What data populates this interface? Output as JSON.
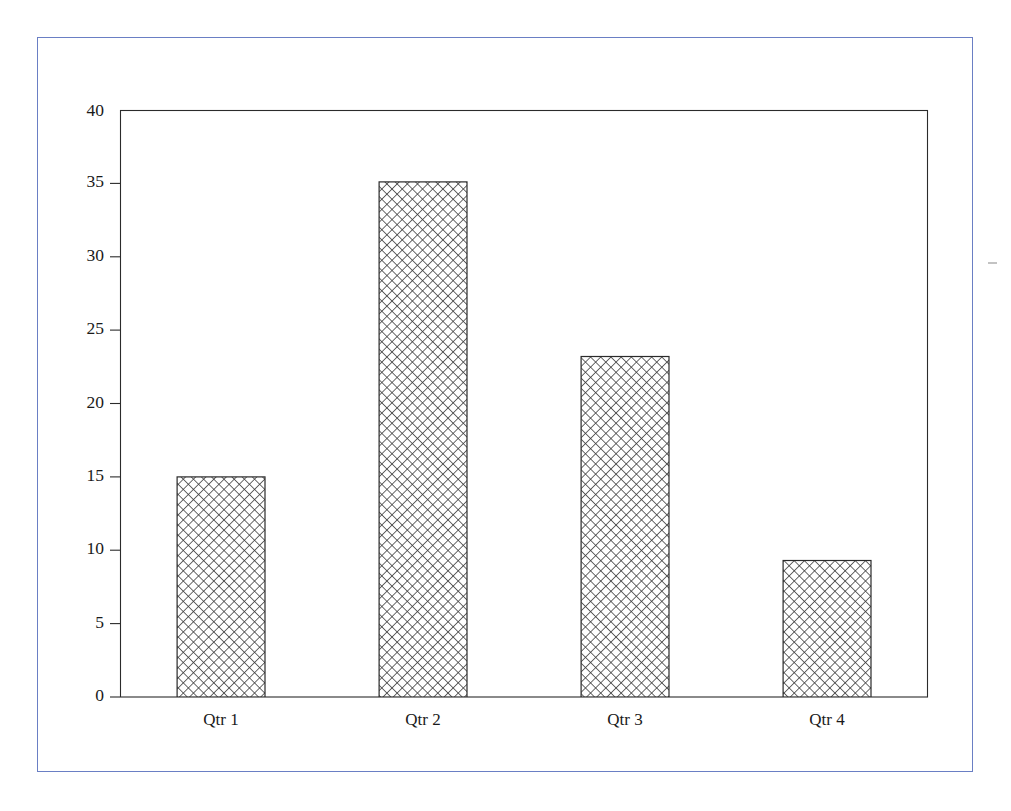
{
  "figure": {
    "border_color": "#6a7fc4",
    "background_color": "#ffffff",
    "axis_color": "#2b2b2b",
    "bar_outline_color": "#2a2a2a",
    "hatch_color": "#3a3a3a"
  },
  "chart_data": {
    "type": "bar",
    "title": "",
    "subtitle": "",
    "xlabel": "",
    "ylabel": "",
    "categories": [
      "Qtr 1",
      "Qtr 2",
      "Qtr 3",
      "Qtr 4"
    ],
    "values": [
      15,
      35.1,
      23.2,
      9.3
    ],
    "series": [
      {
        "name": "",
        "values": [
          15,
          35.1,
          23.2,
          9.3
        ]
      }
    ],
    "ylim": [
      0,
      40
    ],
    "xlim": [
      0,
      4
    ],
    "ytick_labels": [
      "0",
      "5",
      "10",
      "15",
      "20",
      "25",
      "30",
      "35",
      "40"
    ],
    "ytick_values": [
      0,
      5,
      10,
      15,
      20,
      25,
      30,
      35,
      40
    ],
    "xtick_labels": [
      "Qtr 1",
      "Qtr 2",
      "Qtr 3",
      "Qtr 4"
    ],
    "grid": false,
    "legend": false,
    "legend_position": "none",
    "bar_fill": "crosshatch",
    "annotations": []
  }
}
